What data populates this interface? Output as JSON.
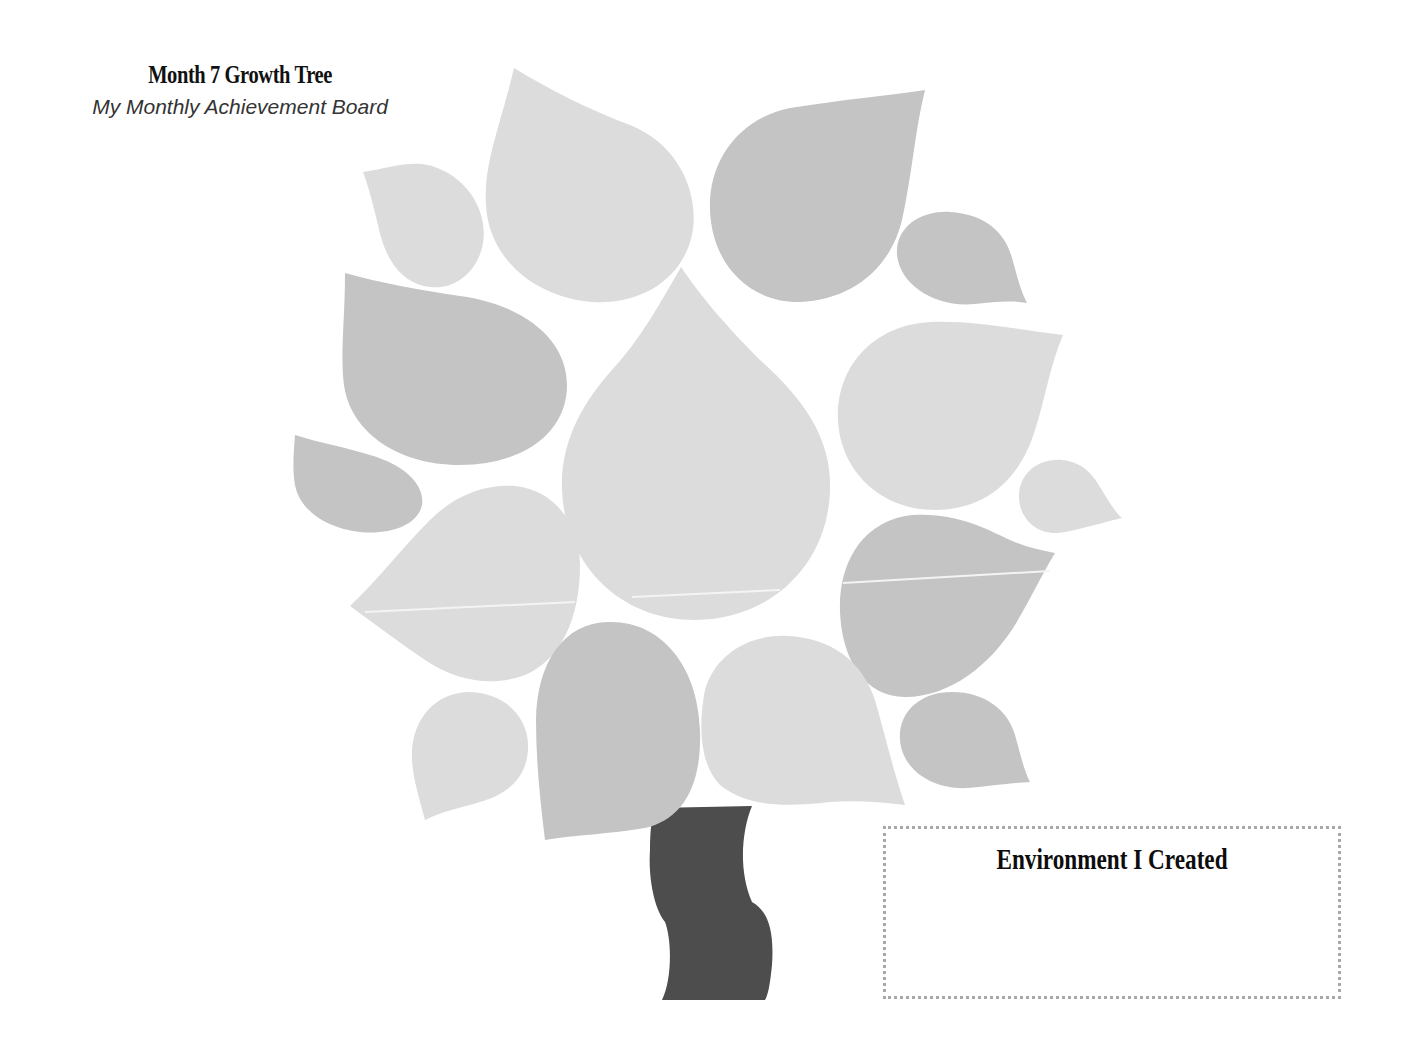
{
  "header": {
    "title": "Month 7 Growth Tree",
    "subtitle": "My Monthly Achievement Board"
  },
  "tree": {
    "colors": {
      "leaf_light": "#dcdcdc",
      "leaf_medium": "#c4c4c4",
      "trunk": "#4d4d4d",
      "background": "#ffffff"
    },
    "leaves": [
      {
        "id": "leaf-1",
        "shade": "light",
        "position": "top-left-small"
      },
      {
        "id": "leaf-2",
        "shade": "light",
        "position": "top-center-large"
      },
      {
        "id": "leaf-3",
        "shade": "medium",
        "position": "top-right-large"
      },
      {
        "id": "leaf-4",
        "shade": "medium",
        "position": "upper-right-small"
      },
      {
        "id": "leaf-5",
        "shade": "medium",
        "position": "left-large"
      },
      {
        "id": "leaf-6",
        "shade": "light",
        "position": "center-large"
      },
      {
        "id": "leaf-7",
        "shade": "light",
        "position": "right-large"
      },
      {
        "id": "leaf-8",
        "shade": "medium",
        "position": "far-left-small"
      },
      {
        "id": "leaf-9",
        "shade": "light",
        "position": "far-right-small"
      },
      {
        "id": "leaf-10",
        "shade": "light",
        "position": "left-middle"
      },
      {
        "id": "leaf-11",
        "shade": "medium",
        "position": "right-middle"
      },
      {
        "id": "leaf-12",
        "shade": "light",
        "position": "bottom-left-small"
      },
      {
        "id": "leaf-13",
        "shade": "medium",
        "position": "bottom-center-left"
      },
      {
        "id": "leaf-14",
        "shade": "light",
        "position": "bottom-center-right"
      },
      {
        "id": "leaf-15",
        "shade": "medium",
        "position": "bottom-right-small"
      }
    ]
  },
  "environment_box": {
    "title": "Environment I Created",
    "content": "",
    "border_color": "#a8a8a8"
  }
}
